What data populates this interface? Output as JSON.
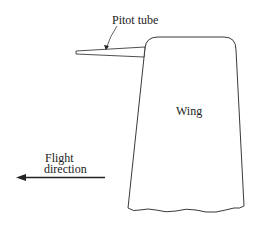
{
  "figure": {
    "labels": {
      "pitot_tube": "Pitot tube",
      "wing": "Wing",
      "flight_line1": "Flight",
      "flight_line2": "direction"
    },
    "colors": {
      "stroke": "#222222",
      "background": "#ffffff"
    }
  }
}
